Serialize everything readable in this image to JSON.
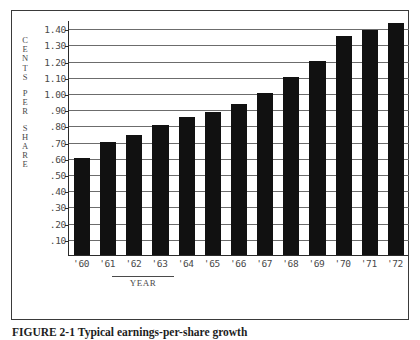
{
  "figure": {
    "caption_number": "FIGURE 2-1",
    "caption_text": "Typical earnings-per-share growth",
    "y_axis_title_chars": [
      "C",
      "E",
      "N",
      "T",
      "S",
      "P",
      "E",
      "R",
      "S",
      "H",
      "A",
      "R",
      "E"
    ],
    "x_axis_title": "YEAR"
  },
  "chart_data": {
    "type": "bar",
    "title": "",
    "subtitle": "",
    "xlabel": "YEAR",
    "ylabel": "CENTS PER SHARE",
    "categories": [
      "'60",
      "'61",
      "'62",
      "'63",
      "'64",
      "'65",
      "'66",
      "'67",
      "'68",
      "'69",
      "'70",
      "'71",
      "'72"
    ],
    "values": [
      0.6,
      0.7,
      0.74,
      0.8,
      0.85,
      0.88,
      0.93,
      1.0,
      1.1,
      1.2,
      1.35,
      1.39,
      1.43
    ],
    "ylim": [
      0,
      1.45
    ],
    "ytick_labels": [
      ".10",
      ".20",
      ".30",
      ".40",
      ".50",
      ".60",
      ".70",
      ".80",
      ".90",
      "1.00",
      "1.10",
      "1.20",
      "1.30",
      "1.40"
    ],
    "ytick_values": [
      0.1,
      0.2,
      0.3,
      0.4,
      0.5,
      0.6,
      0.7,
      0.8,
      0.9,
      1.0,
      1.1,
      1.2,
      1.3,
      1.4
    ],
    "grid": true,
    "grid_axis": "y",
    "legend": false,
    "bar_color": "#111111",
    "axis_color": "#2b2b2b",
    "grid_color": "#6c6c6c",
    "background": "#ffffff"
  }
}
